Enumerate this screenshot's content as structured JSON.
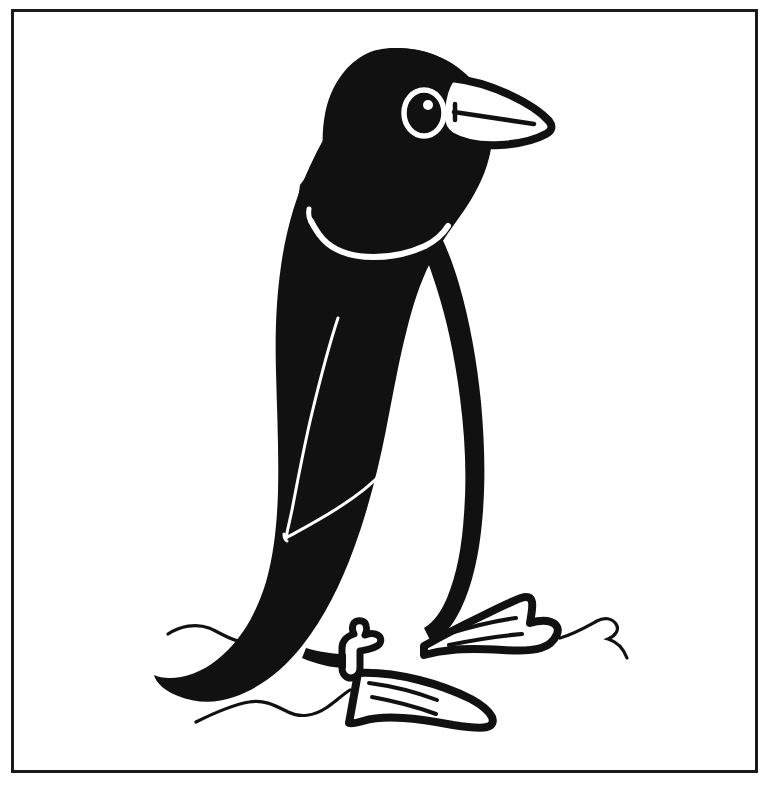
{
  "document": {
    "title": "Penguin",
    "kind": "line-art-illustration",
    "background_color": "#ffffff",
    "ink_color": "#111111",
    "canvas": {
      "width": 781,
      "height": 798
    }
  },
  "frame": {
    "name": "rectangular-border",
    "x": 11,
    "y": 9,
    "width": 744,
    "height": 761,
    "stroke_color": "#1a1a1a",
    "stroke_width": 3
  },
  "illustration": {
    "subject": "penguin",
    "style": "high-contrast black silhouette with white line details",
    "facing": "right",
    "parts": [
      {
        "name": "head",
        "fill": "#111111",
        "description": "solid black rounded head"
      },
      {
        "name": "eye",
        "fill": "#111111",
        "ring": "#ffffff",
        "description": "white ring with black pupil and small white highlight"
      },
      {
        "name": "beak",
        "fill": "#ffffff",
        "outline": "#111111",
        "description": "pointed white beak with black outline and interior line"
      },
      {
        "name": "chin-strap",
        "fill": "#ffffff",
        "description": "thin white line across the throat"
      },
      {
        "name": "back",
        "fill": "#111111",
        "description": "solid black back and tail"
      },
      {
        "name": "belly",
        "fill": "#ffffff",
        "outline": "#111111",
        "description": "white front outlined in black"
      },
      {
        "name": "wing",
        "stroke": "#ffffff",
        "description": "flipper outlined by two thin white curves"
      },
      {
        "name": "left-foot",
        "fill": "#ffffff",
        "outline": "#111111",
        "description": "webbed foot with toe lines"
      },
      {
        "name": "right-foot",
        "fill": "#ffffff",
        "outline": "#111111",
        "description": "webbed foot with toe lines"
      },
      {
        "name": "ground-lines",
        "stroke": "#111111",
        "description": "thin wavy ground strokes at left and right"
      }
    ]
  },
  "colors": {
    "ink": "#111111",
    "paper": "#ffffff",
    "frame": "#1a1a1a"
  }
}
